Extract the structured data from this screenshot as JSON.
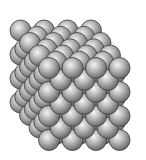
{
  "figure": {
    "background": "#ffffff",
    "sphere_color_light": "#f2f2f2",
    "sphere_color_mid": "#a6a6a6",
    "sphere_color_dark": "#5a5a5a",
    "sphere_outline": "#3c3c3c",
    "cells": [
      3,
      3,
      3
    ],
    "radius": 10.5,
    "origin": [
      49,
      140
    ],
    "axis_x": [
      23.5,
      0
    ],
    "axis_y": [
      0,
      -24
    ],
    "axis_z": [
      -9.5,
      -12.5
    ]
  }
}
